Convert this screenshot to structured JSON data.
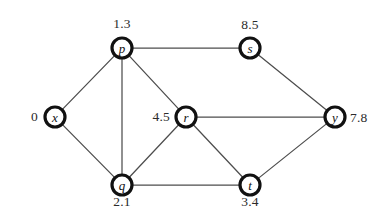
{
  "diagram": {
    "type": "undirected-weighted-graph-node-distances",
    "background_color": "#ffffff",
    "edge_color": "#4d4d4d",
    "node_stroke_color": "#111111",
    "node_fill_color": "#ffffff",
    "label_color": "#2b2b2b",
    "nodes": [
      {
        "id": "p",
        "letter": "p",
        "distance": "1.3",
        "cx": 122,
        "cy": 48,
        "r": 10,
        "label_x": 122,
        "label_y": 24,
        "label_pos": "center"
      },
      {
        "id": "s",
        "letter": "s",
        "distance": "8.5",
        "cx": 250,
        "cy": 48,
        "r": 10,
        "label_x": 250,
        "label_y": 25,
        "label_pos": "center"
      },
      {
        "id": "x",
        "letter": "x",
        "distance": "0",
        "cx": 55,
        "cy": 117,
        "r": 10,
        "label_x": 38,
        "label_y": 117,
        "label_pos": "left-of"
      },
      {
        "id": "r",
        "letter": "r",
        "distance": "4.5",
        "cx": 186,
        "cy": 117,
        "r": 10,
        "label_x": 170,
        "label_y": 117,
        "label_pos": "left-of"
      },
      {
        "id": "y",
        "letter": "y",
        "distance": "7.8",
        "cx": 335,
        "cy": 117,
        "r": 10,
        "label_x": 350,
        "label_y": 118,
        "label_pos": "right-of"
      },
      {
        "id": "q",
        "letter": "q",
        "distance": "2.1",
        "cx": 122,
        "cy": 185,
        "r": 10,
        "label_x": 122,
        "label_y": 202,
        "label_pos": "center"
      },
      {
        "id": "t",
        "letter": "t",
        "distance": "3.4",
        "cx": 250,
        "cy": 185,
        "r": 10,
        "label_x": 250,
        "label_y": 202,
        "label_pos": "center"
      }
    ],
    "edges": [
      {
        "from": "x",
        "to": "p"
      },
      {
        "from": "x",
        "to": "q"
      },
      {
        "from": "p",
        "to": "s"
      },
      {
        "from": "p",
        "to": "q"
      },
      {
        "from": "p",
        "to": "r"
      },
      {
        "from": "s",
        "to": "y"
      },
      {
        "from": "r",
        "to": "q"
      },
      {
        "from": "r",
        "to": "y"
      },
      {
        "from": "r",
        "to": "t"
      },
      {
        "from": "q",
        "to": "t"
      },
      {
        "from": "t",
        "to": "y"
      }
    ]
  }
}
